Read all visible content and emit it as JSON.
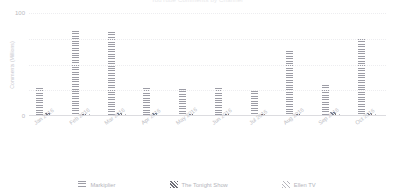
{
  "chart_data": {
    "type": "bar",
    "title": "YouTube Comments by Channel",
    "xlabel": "",
    "ylabel": "Comments (Millions)",
    "ylim": [
      0,
      100
    ],
    "yticks": [
      0,
      100
    ],
    "ytick_labels": [
      "0",
      "100"
    ],
    "gridlines": [
      25,
      50,
      75,
      100
    ],
    "grid": true,
    "legend_position": "bottom",
    "categories": [
      "Jan 2016",
      "Feb 2016",
      "Mar 2016",
      "Apr 2016",
      "May 2016",
      "Jun 2016",
      "Jul 2016",
      "Aug 2016",
      "Sep 2016",
      "Oct 2016"
    ],
    "series": [
      {
        "name": "Markiplier",
        "pattern": "horizontal-stripes",
        "color": "#9d9da6",
        "values": [
          27,
          83,
          82,
          27,
          26,
          27,
          24,
          63,
          30,
          75
        ]
      },
      {
        "name": "The Tonight Show",
        "pattern": "diagonal-dense",
        "color": "#6f6f78",
        "values": [
          3,
          2,
          3,
          3,
          2,
          2,
          2,
          2,
          4,
          3
        ]
      },
      {
        "name": "Ellen TV",
        "pattern": "crosshatch",
        "color": "#b6b6bd",
        "values": [
          1,
          2,
          2,
          1,
          1,
          1,
          1,
          1,
          2,
          2
        ]
      }
    ]
  },
  "legend": {
    "items": [
      {
        "label": "Markiplier",
        "icon": "stripes-swatch-icon"
      },
      {
        "label": "The Tonight Show",
        "icon": "diagonal-swatch-icon"
      },
      {
        "label": "Ellen TV",
        "icon": "crosshatch-swatch-icon"
      }
    ]
  }
}
